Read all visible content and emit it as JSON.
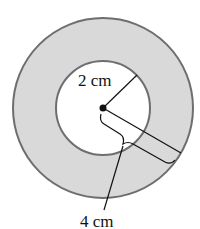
{
  "diagram": {
    "title": "",
    "shapes": {
      "outer_circle": {
        "cx": 103,
        "cy": 108,
        "r": 90,
        "fill": "#d9d9d9",
        "stroke": "#6e6e6e"
      },
      "inner_circle": {
        "cx": 103,
        "cy": 108,
        "r": 47,
        "fill": "#ffffff",
        "stroke": "#6e6e6e"
      },
      "center_point": {
        "cx": 103,
        "cy": 108
      }
    },
    "labels": {
      "inner_radius": "2 cm",
      "outer_radius": "4 cm"
    },
    "colors": {
      "ring_fill": "#d9d9d9",
      "circle_stroke": "#6e6e6e",
      "line": "#111111"
    }
  }
}
